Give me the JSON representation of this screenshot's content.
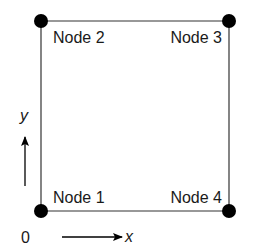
{
  "diagram": {
    "type": "quadrilateral element with four corner nodes",
    "nodes": [
      {
        "id": 1,
        "label": "Node 1",
        "corner": "bottom-left"
      },
      {
        "id": 2,
        "label": "Node 2",
        "corner": "top-left"
      },
      {
        "id": 3,
        "label": "Node 3",
        "corner": "top-right"
      },
      {
        "id": 4,
        "label": "Node 4",
        "corner": "bottom-right"
      }
    ],
    "edges": [
      {
        "from": 1,
        "to": 2
      },
      {
        "from": 2,
        "to": 3
      },
      {
        "from": 3,
        "to": 4
      },
      {
        "from": 4,
        "to": 1
      }
    ],
    "axes": {
      "origin_label": "0",
      "x_label": "x",
      "y_label": "y"
    },
    "colors": {
      "line": "#333333",
      "node": "#000000",
      "text": "#1a1a1a"
    }
  }
}
